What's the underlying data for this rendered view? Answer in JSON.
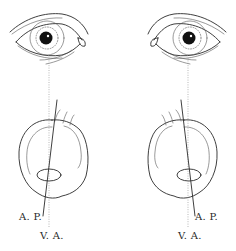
{
  "figure": {
    "type": "anatomical-diagram",
    "panels": [
      {
        "side": "left",
        "labels": {
          "ap": "A. P.",
          "va": "V. A."
        }
      },
      {
        "side": "right",
        "labels": {
          "ap": "A. P.",
          "va": "V. A."
        }
      }
    ],
    "colors": {
      "ink": "#2a2a2a",
      "dotted_axis": "#9a9a9a",
      "background": "#ffffff"
    }
  }
}
